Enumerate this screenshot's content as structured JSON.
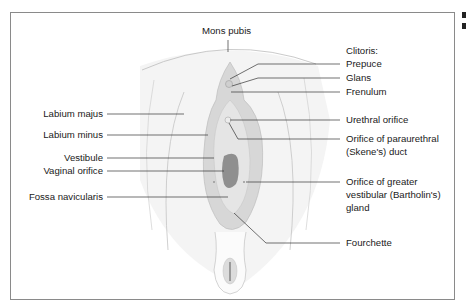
{
  "diagram": {
    "labels": {
      "mons_pubis": "Mons pubis",
      "clitoris_heading": "Clitoris:",
      "prepuce": "Prepuce",
      "glans": "Glans",
      "frenulum": "Frenulum",
      "labium_majus": "Labium majus",
      "labium_minus": "Labium minus",
      "vestibule": "Vestibule",
      "vaginal_orifice": "Vaginal orifice",
      "fossa_navicularis": "Fossa navicularis",
      "urethral_orifice": "Urethral orifice",
      "paraurethral_line1": "Orifice of paraurethral",
      "paraurethral_line2": "(Skene's) duct",
      "bartholin_line1": "Orifice of greater",
      "bartholin_line2": "vestibular (Bartholin's)",
      "bartholin_line3": "gland",
      "fourchette": "Fourchette"
    },
    "colors": {
      "skin": "#f2f2f2",
      "labia": "#d9d9d9",
      "inner": "#e6e6e6",
      "orifice": "#8c8c8c",
      "outline": "#b5b5b5",
      "leader": "#333333"
    }
  }
}
